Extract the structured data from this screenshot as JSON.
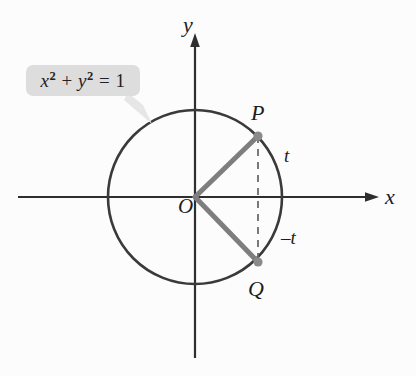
{
  "figure": {
    "axes": {
      "x_label": "x",
      "y_label": "y",
      "origin_label": "O"
    },
    "callout": {
      "equation_plain": "x2 + y2 = 1",
      "lhs_var1": "x",
      "lhs_exp1": "2",
      "operator": " + ",
      "lhs_var2": "y",
      "lhs_exp2": "2",
      "equals": " = ",
      "rhs": "1",
      "box_color": "#dddddd",
      "tail_color": "#e4e4e4"
    },
    "points": [
      {
        "name": "P",
        "label": "P",
        "arc_label": "t",
        "cx": 258,
        "cy": 136
      },
      {
        "name": "Q",
        "label": "Q",
        "arc_label": "-t",
        "cx": 258,
        "cy": 262
      }
    ],
    "arc_labels": {
      "upper": "t",
      "lower": "–t"
    },
    "colors": {
      "circle_stroke": "#3a3a3a",
      "axis_stroke": "#2e2e2e",
      "radius_stroke": "#7e7e7e",
      "dashed_stroke": "#6b6b6b",
      "point_fill": "#8a8a8a",
      "text": "#1d1d1d",
      "background": "#fcfcfc"
    },
    "geometry": {
      "center_x": 195,
      "center_y": 197,
      "radius": 87,
      "x_axis_start": 18,
      "x_axis_end": 378,
      "y_axis_top": 36,
      "y_axis_bottom": 358
    }
  }
}
